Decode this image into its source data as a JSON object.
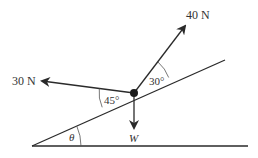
{
  "diagram": {
    "type": "force-diagram-inclined-plane",
    "colors": {
      "line": "#2a2a2a",
      "text": "#333333",
      "background": "#ffffff"
    },
    "forces": [
      {
        "id": "force-40",
        "label": "40 N",
        "angle_to_plane": "30°"
      },
      {
        "id": "force-30",
        "label": "30 N",
        "angle_to_plane": "45°"
      },
      {
        "id": "weight",
        "label": "W"
      }
    ],
    "angles": {
      "incline": "θ",
      "force_40_angle": "30°",
      "force_30_angle": "45°"
    }
  }
}
